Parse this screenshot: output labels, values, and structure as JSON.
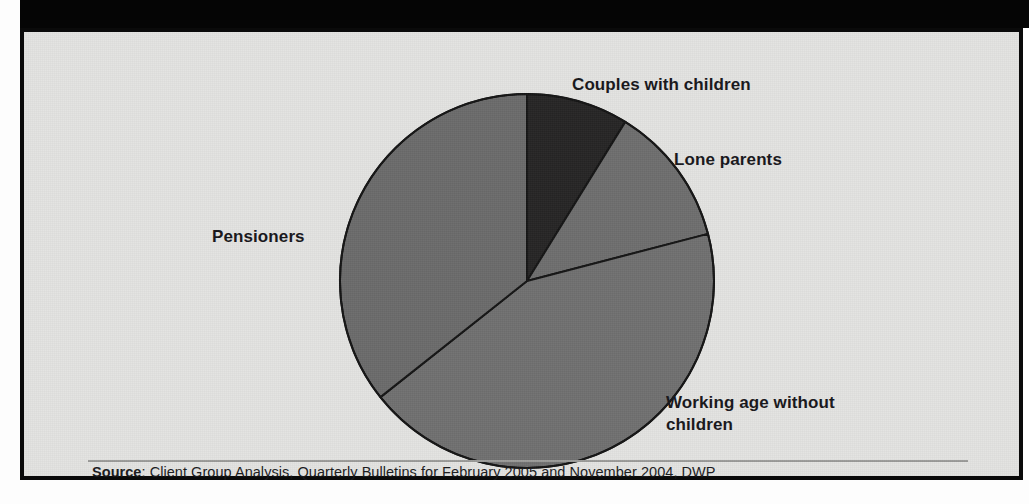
{
  "figure": {
    "background_color": "#e3e3e1",
    "border_color": "#0a0a0a",
    "top_band_color": "#050505"
  },
  "source": {
    "label": "Source",
    "separator": ":",
    "text": " Client Group Analysis, Quarterly Bulletins for February 2005 and November 2004, DWP",
    "full": "Source: Client Group Analysis, Quarterly Bulletins for February 2005 and November 2004, DWP"
  },
  "labels": {
    "couples": "Couples with children",
    "lone_parents": "Lone parents",
    "pensioners": "Pensioners",
    "working_age_line1": "Working age without",
    "working_age_line2": "children"
  },
  "chart_data": {
    "type": "pie",
    "title": "",
    "subtitle": "",
    "xlabel": "",
    "ylabel": "",
    "grid": false,
    "legend_position": "outside-callout-labels",
    "start_angle_deg": 0,
    "direction": "clockwise",
    "center": {
      "x": 503,
      "y": 249
    },
    "radius": 187,
    "categories": [
      "Couples with children",
      "Lone parents",
      "Working age without children",
      "Pensioners"
    ],
    "values": [
      8.8,
      12.1,
      43.4,
      35.7
    ],
    "value_unit": "percent",
    "slices": [
      {
        "name": "Couples with children",
        "value": 8.8,
        "start_angle_deg": 0.0,
        "end_angle_deg": 31.7,
        "color": "#262525",
        "label_position": "upper-right"
      },
      {
        "name": "Lone parents",
        "value": 12.1,
        "start_angle_deg": 31.7,
        "end_angle_deg": 75.4,
        "color": "#6e6e6e",
        "label_position": "right"
      },
      {
        "name": "Working age without children",
        "value": 43.4,
        "start_angle_deg": 75.4,
        "end_angle_deg": 231.6,
        "color": "#707070",
        "label_position": "lower-right"
      },
      {
        "name": "Pensioners",
        "value": 35.7,
        "start_angle_deg": 231.6,
        "end_angle_deg": 360.0,
        "color": "#6b6b6b",
        "label_position": "left"
      }
    ],
    "slice_outline_color": "#141414"
  }
}
